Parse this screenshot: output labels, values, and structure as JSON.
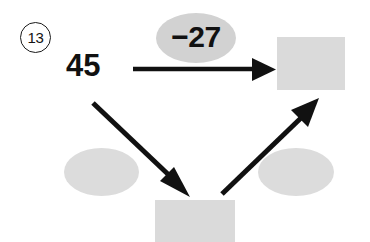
{
  "problem": {
    "number": "13",
    "start_value": "45"
  },
  "operations": {
    "top": {
      "label": "−27",
      "filled": true
    },
    "bottom_left": {
      "label": "",
      "filled": false
    },
    "bottom_right": {
      "label": "",
      "filled": false
    }
  },
  "answers": {
    "top_right": {
      "value": ""
    },
    "bottom": {
      "value": ""
    }
  },
  "arrows": [
    {
      "name": "arrow-right-horizontal",
      "from": "start-number",
      "to": "box-top-right"
    },
    {
      "name": "arrow-down-right-diagonal",
      "from": "start-number",
      "to": "box-bottom"
    },
    {
      "name": "arrow-up-right-diagonal",
      "from": "box-bottom",
      "to": "box-top-right"
    }
  ],
  "colors": {
    "box_gray": "#dadada",
    "oval_gray": "#dcdcdc",
    "ink": "#111111"
  }
}
